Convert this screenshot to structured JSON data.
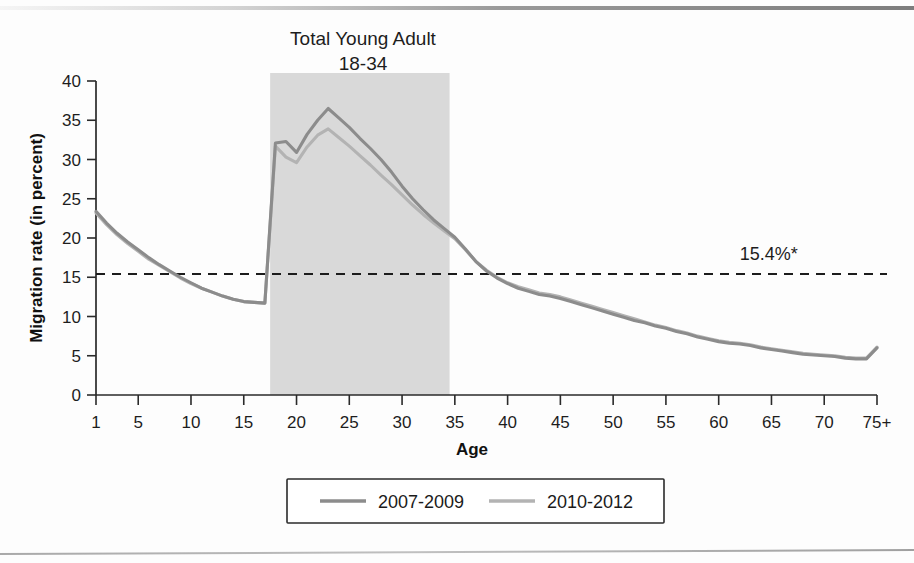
{
  "figure": {
    "title_line1": "Total Young Adult",
    "title_line2": "18-34",
    "reference_label": "15.4%*"
  },
  "chart_data": {
    "type": "line",
    "title": "Total Young Adult 18-34",
    "xlabel": "Age",
    "ylabel": "Migration rate (in percent)",
    "xlim": [
      1,
      75
    ],
    "ylim": [
      0,
      40
    ],
    "grid": false,
    "legend_position": "bottom",
    "x_tick_labels": [
      "1",
      "5",
      "10",
      "15",
      "20",
      "25",
      "30",
      "35",
      "40",
      "45",
      "50",
      "55",
      "60",
      "65",
      "70",
      "75+"
    ],
    "x_tick_values": [
      1,
      5,
      10,
      15,
      20,
      25,
      30,
      35,
      40,
      45,
      50,
      55,
      60,
      65,
      70,
      75
    ],
    "y_tick_labels": [
      "0",
      "5",
      "10",
      "15",
      "20",
      "25",
      "30",
      "35",
      "40"
    ],
    "y_tick_values": [
      0,
      5,
      10,
      15,
      20,
      25,
      30,
      35,
      40
    ],
    "annotations": [
      {
        "name": "national-average-reference",
        "text": "15.4%*",
        "type": "hline",
        "y": 15.4,
        "x_text": 62
      },
      {
        "name": "young-adult-band",
        "text": "Total Young Adult 18-34",
        "type": "vband",
        "x0": 17.5,
        "x1": 34.5,
        "color": "#d9d9d9"
      }
    ],
    "x": [
      1,
      2,
      3,
      4,
      5,
      6,
      7,
      8,
      9,
      10,
      11,
      12,
      13,
      14,
      15,
      16,
      17,
      18,
      19,
      20,
      21,
      22,
      23,
      24,
      25,
      26,
      27,
      28,
      29,
      30,
      31,
      32,
      33,
      34,
      35,
      36,
      37,
      38,
      39,
      40,
      41,
      42,
      43,
      44,
      45,
      46,
      47,
      48,
      49,
      50,
      51,
      52,
      53,
      54,
      55,
      56,
      57,
      58,
      59,
      60,
      61,
      62,
      63,
      64,
      65,
      66,
      67,
      68,
      69,
      70,
      71,
      72,
      73,
      74,
      75
    ],
    "series": [
      {
        "name": "2007-2009",
        "color": "#8c8c8c",
        "values": [
          23.4,
          21.9,
          20.6,
          19.5,
          18.5,
          17.5,
          16.6,
          15.8,
          15.0,
          14.3,
          13.6,
          13.1,
          12.6,
          12.2,
          11.9,
          11.8,
          11.7,
          32.1,
          32.3,
          30.9,
          33.2,
          35.0,
          36.5,
          35.3,
          34.1,
          32.7,
          31.4,
          30.0,
          28.4,
          26.6,
          25.0,
          23.6,
          22.3,
          21.2,
          20.1,
          18.6,
          17.0,
          15.8,
          14.9,
          14.2,
          13.6,
          13.2,
          12.8,
          12.6,
          12.3,
          11.9,
          11.5,
          11.1,
          10.7,
          10.3,
          9.9,
          9.5,
          9.2,
          8.8,
          8.5,
          8.1,
          7.8,
          7.4,
          7.1,
          6.8,
          6.6,
          6.5,
          6.3,
          6.0,
          5.8,
          5.6,
          5.4,
          5.2,
          5.1,
          5.0,
          4.9,
          4.7,
          4.6,
          4.6,
          6.0
        ]
      },
      {
        "name": "2010-2012",
        "color": "#b3b3b3",
        "values": [
          23.2,
          21.7,
          20.4,
          19.3,
          18.3,
          17.3,
          16.5,
          15.7,
          14.9,
          14.2,
          13.6,
          13.1,
          12.6,
          12.2,
          11.9,
          11.8,
          11.7,
          31.7,
          30.3,
          29.6,
          31.6,
          33.1,
          33.9,
          32.8,
          31.7,
          30.5,
          29.3,
          28.0,
          26.8,
          25.5,
          24.2,
          23.0,
          21.9,
          20.9,
          19.9,
          18.5,
          17.0,
          15.9,
          15.0,
          14.3,
          13.8,
          13.4,
          13.0,
          12.8,
          12.5,
          12.1,
          11.7,
          11.3,
          10.9,
          10.5,
          10.1,
          9.7,
          9.3,
          8.9,
          8.6,
          8.2,
          7.9,
          7.5,
          7.2,
          6.9,
          6.7,
          6.6,
          6.4,
          6.1,
          5.9,
          5.7,
          5.5,
          5.3,
          5.2,
          5.1,
          5.0,
          4.8,
          4.7,
          4.7,
          6.1
        ]
      }
    ]
  },
  "legend": {
    "items": [
      {
        "label": "2007-2009",
        "color": "#8c8c8c"
      },
      {
        "label": "2010-2012",
        "color": "#b3b3b3"
      }
    ]
  }
}
